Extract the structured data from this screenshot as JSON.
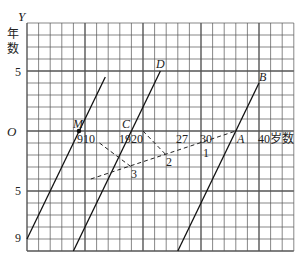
{
  "axes": {
    "y_axis_letter": "Y",
    "y_axis_unit": [
      "年",
      "数"
    ],
    "origin_label": "O",
    "x_axis_unit": "40岁数",
    "y_ticks_above": [
      {
        "value": 5,
        "label": "5"
      }
    ],
    "y_ticks_below": [
      {
        "value": 5,
        "label": "5"
      },
      {
        "value": 9,
        "label": "9"
      }
    ],
    "x_tick_labels": [
      {
        "x": 9,
        "label": "9"
      },
      {
        "x": 10,
        "label": "10"
      },
      {
        "x": 19,
        "label": "19"
      },
      {
        "x": 20,
        "label": "20"
      },
      {
        "x": 27,
        "label": "27"
      },
      {
        "x": 30,
        "label": "30"
      }
    ]
  },
  "grid": {
    "x_min": 0,
    "x_max": 46,
    "x_step": 2,
    "y_min": -10,
    "y_max": 9,
    "y_step": 1,
    "major_every_x": 10,
    "major_every_y": 5,
    "line_color": "#555555"
  },
  "points": [
    {
      "label": "M",
      "x": 9,
      "y": 0
    },
    {
      "label": "C",
      "x": 19,
      "y": 0
    },
    {
      "label": "D",
      "x": 22.5,
      "y": 5
    },
    {
      "label": "A",
      "x": 36,
      "y": 0
    },
    {
      "label": "B",
      "x": 40,
      "y": 4
    },
    {
      "label": "1",
      "x": 30,
      "y": -1
    },
    {
      "label": "2",
      "x": 24,
      "y": -2
    },
    {
      "label": "3",
      "x": 18,
      "y": -3
    }
  ],
  "solid_lines": [
    {
      "name": "line-through-M",
      "from": [
        0,
        -9
      ],
      "to": [
        13.5,
        4.5
      ]
    },
    {
      "name": "line-C-D",
      "from": [
        8,
        -10
      ],
      "to": [
        23,
        5
      ]
    },
    {
      "name": "line-A-B",
      "from": [
        26,
        -10
      ],
      "to": [
        40,
        4
      ]
    }
  ],
  "dashed_lines": [
    {
      "name": "dash-10-to-3",
      "from": [
        12.5,
        -1
      ],
      "to": [
        18,
        -3
      ]
    },
    {
      "name": "dash-20-to-2",
      "from": [
        20,
        0
      ],
      "to": [
        24,
        -2
      ]
    },
    {
      "name": "dash-chain-to-A",
      "from": [
        11,
        -4
      ],
      "to": [
        36,
        0
      ]
    }
  ]
}
